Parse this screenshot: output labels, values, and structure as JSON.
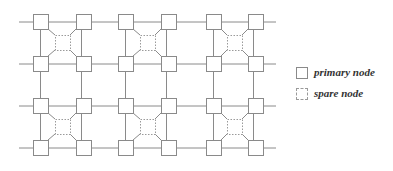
{
  "diagram": {
    "grid": {
      "rows": 4,
      "cols": 6
    },
    "clusters": [
      {
        "cluster": 1,
        "spare_positions": [
          "upper",
          "lower"
        ]
      },
      {
        "cluster": 2,
        "spare_positions": [
          "upper",
          "lower"
        ]
      },
      {
        "cluster": 3,
        "spare_positions": [
          "upper",
          "lower"
        ]
      }
    ],
    "colors": {
      "line": "#8a8a8a",
      "primary_border": "#8a8a8a",
      "spare_border": "#9a9a9a",
      "text": "#333333"
    }
  },
  "legend": {
    "items": [
      {
        "kind": "primary",
        "label": "primary node"
      },
      {
        "kind": "spare",
        "label": "spare node"
      }
    ]
  }
}
